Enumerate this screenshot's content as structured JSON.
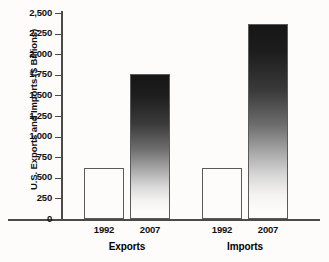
{
  "chart_data": {
    "type": "bar",
    "title": "",
    "xlabel": "",
    "ylabel": "U.S. Exports and Imports ($ Billions)",
    "ylim": [
      0,
      2500
    ],
    "ytick_interval": 250,
    "grid": false,
    "legend": null,
    "groups": [
      "Exports",
      "Imports"
    ],
    "categories": [
      "1992",
      "2007",
      "1992",
      "2007"
    ],
    "ytick_labels": [
      "2,500",
      "2,250",
      "2,000",
      "1,750",
      "1,500",
      "1,250",
      "1,000",
      "750",
      "500",
      "250",
      "0"
    ],
    "ytick_values": [
      2500,
      2250,
      2000,
      1750,
      1500,
      1250,
      1000,
      750,
      500,
      250,
      0
    ],
    "bars": [
      {
        "group": "Exports",
        "category": "1992",
        "value": 620,
        "style": "hollow"
      },
      {
        "group": "Exports",
        "category": "2007",
        "value": 1760,
        "style": "gradient"
      },
      {
        "group": "Imports",
        "category": "1992",
        "value": 620,
        "style": "hollow"
      },
      {
        "group": "Imports",
        "category": "2007",
        "value": 2370,
        "style": "gradient"
      }
    ],
    "colors": {
      "hollow_fill": "#fdfcfa",
      "bar_outline": "#5a5a5a",
      "gradient_top": "#161616",
      "gradient_bottom": "#fdfcfa",
      "axis": "#4a4a4a",
      "text": "#111111",
      "background": "#fdfcfa"
    }
  }
}
